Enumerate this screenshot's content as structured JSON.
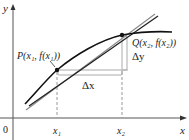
{
  "diagram": {
    "type": "secant-tangent-derivative",
    "axes": {
      "x_label": "x",
      "y_label": "y",
      "origin_label": "0"
    },
    "points": {
      "P": {
        "label": "P(x₁, f(x₁))",
        "name": "P",
        "arg": "x₁",
        "fn": "f(x₁)"
      },
      "Q": {
        "label": "Q(x₂, f(x₂))",
        "name": "Q",
        "arg": "x₂",
        "fn": "f(x₂)"
      }
    },
    "ticks": {
      "x1": "x₁",
      "x2": "x₂"
    },
    "increments": {
      "dx": "Δx",
      "dy": "Δy"
    },
    "lines": [
      "curve y = f(x)",
      "secant line PQ",
      "tangent line at P"
    ],
    "colors": {
      "axis": "#333333",
      "curve": "#111111",
      "secant": "#222222",
      "tangent": "#8a8a8a",
      "guide": "#9a9a9a"
    }
  }
}
